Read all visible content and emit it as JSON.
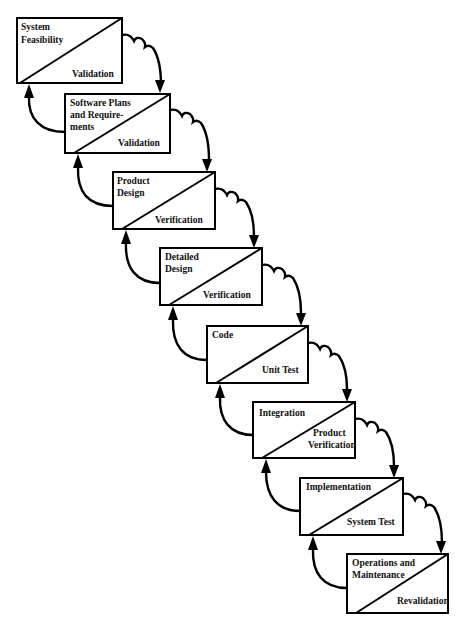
{
  "diagram": {
    "colors": {
      "stroke": "#000000",
      "background": "#ffffff",
      "text": "#111111"
    },
    "stages": [
      {
        "id": "system-feasibility",
        "top_label": [
          "System",
          "Feasibility"
        ],
        "bottom_label": [
          "Validation"
        ]
      },
      {
        "id": "software-plans",
        "top_label": [
          "Software Plans",
          "and Require-",
          "ments"
        ],
        "bottom_label": [
          "Validation"
        ]
      },
      {
        "id": "product-design",
        "top_label": [
          "Product",
          "Design"
        ],
        "bottom_label": [
          "Verification"
        ]
      },
      {
        "id": "detailed-design",
        "top_label": [
          "Detailed",
          "Design"
        ],
        "bottom_label": [
          "Verification"
        ]
      },
      {
        "id": "code",
        "top_label": [
          "Code"
        ],
        "bottom_label": [
          "Unit Test"
        ]
      },
      {
        "id": "integration",
        "top_label": [
          "Integration"
        ],
        "bottom_label": [
          "Product",
          "Verification"
        ]
      },
      {
        "id": "implementation",
        "top_label": [
          "Implementation"
        ],
        "bottom_label": [
          "System Test"
        ]
      },
      {
        "id": "operations-maintenance",
        "top_label": [
          "Operations and",
          "Maintenance"
        ],
        "bottom_label": [
          "Revalidation"
        ]
      }
    ],
    "arrows": {
      "forward": "cloud-shaped arrow from each stage to the next stage",
      "feedback": "curved arrow from each stage back to the previous stage"
    }
  }
}
